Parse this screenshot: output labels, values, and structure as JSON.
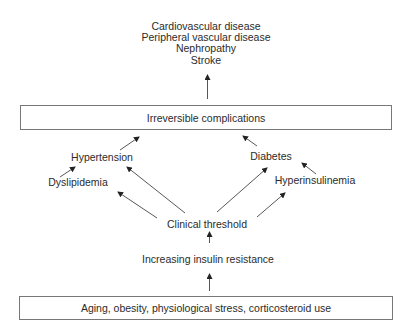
{
  "diagram": {
    "outcomes": [
      "Cardiovascular disease",
      "Peripheral vascular disease",
      "Nephropathy",
      "Stroke"
    ],
    "top_box": "Irreversible complications",
    "intermediate": {
      "hypertension": "Hypertension",
      "dyslipidemia": "Dyslipidemia",
      "diabetes": "Diabetes",
      "hyperinsulinemia": "Hyperinsulinemia"
    },
    "threshold": "Clinical threshold",
    "insulin_resistance": "Increasing insulin resistance",
    "bottom_box": "Aging, obesity, physiological stress, corticosteroid use",
    "caption_clipped": "",
    "colors": {
      "text": "#2b2b2b",
      "arrow": "#333333",
      "box_border": "#777777",
      "background": "#ffffff"
    },
    "edges": [
      {
        "from": "Irreversible complications",
        "to": "Outcomes"
      },
      {
        "from": "Hypertension",
        "to": "Irreversible complications"
      },
      {
        "from": "Diabetes",
        "to": "Irreversible complications"
      },
      {
        "from": "Dyslipidemia",
        "to": "Hypertension"
      },
      {
        "from": "Hyperinsulinemia",
        "to": "Diabetes"
      },
      {
        "from": "Clinical threshold",
        "to": "Hypertension"
      },
      {
        "from": "Clinical threshold",
        "to": "Dyslipidemia"
      },
      {
        "from": "Clinical threshold",
        "to": "Diabetes"
      },
      {
        "from": "Clinical threshold",
        "to": "Hyperinsulinemia"
      },
      {
        "from": "Increasing insulin resistance",
        "to": "Clinical threshold"
      },
      {
        "from": "Aging, obesity, physiological stress, corticosteroid use",
        "to": "Increasing insulin resistance"
      }
    ]
  }
}
